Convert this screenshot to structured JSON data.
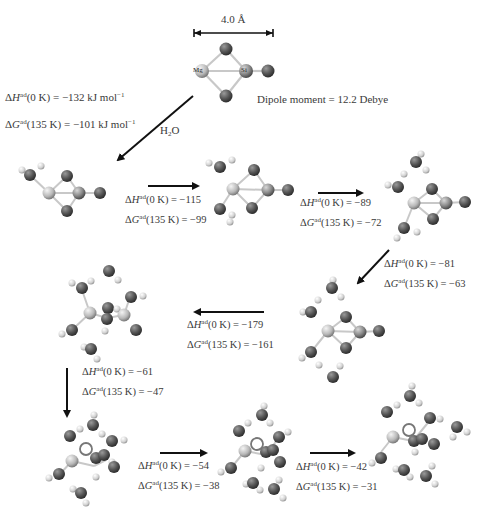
{
  "scale_bar": {
    "label": "4.0 Å"
  },
  "initial_cluster": {
    "atom_labels": [
      "Mg",
      "Si",
      "O",
      "O",
      "O"
    ],
    "dipole_label": "Dipole moment = 12.2 Debye",
    "dipole_value": "12.2",
    "dipole_unit": "Debye"
  },
  "reactant": {
    "label": "H2O",
    "label_main": "H",
    "label_sub": "2",
    "label_tail": "O"
  },
  "steps": [
    {
      "id": 1,
      "dH_prefix": "ΔH",
      "dH_temp": "(0 K) = ",
      "dH_value": "−132 kJ mol",
      "dH_unit_exp": "−1",
      "dG_prefix": "ΔG",
      "dG_temp": "(135 K) = ",
      "dG_value": "−101 kJ mol",
      "dG_unit_exp": "−1"
    },
    {
      "id": 2,
      "dH_prefix": "ΔH",
      "dH_temp": "(0 K) = ",
      "dH_value": "−115",
      "dG_prefix": "ΔG",
      "dG_temp": "(135 K) = ",
      "dG_value": "−99"
    },
    {
      "id": 3,
      "dH_prefix": "ΔH",
      "dH_temp": "(0 K) = ",
      "dH_value": "−89",
      "dG_prefix": "ΔG",
      "dG_temp": "(135 K) = ",
      "dG_value": "−72"
    },
    {
      "id": 4,
      "dH_prefix": "ΔH",
      "dH_temp": "(0 K) = ",
      "dH_value": "−81",
      "dG_prefix": "ΔG",
      "dG_temp": "(135 K) = ",
      "dG_value": "−63"
    },
    {
      "id": 5,
      "dH_prefix": "ΔH",
      "dH_temp": "(0 K) = ",
      "dH_value": "−179",
      "dG_prefix": "ΔG",
      "dG_temp": "(135 K) = ",
      "dG_value": "−161"
    },
    {
      "id": 6,
      "dH_prefix": "ΔH",
      "dH_temp": "(0 K) = ",
      "dH_value": "−61",
      "dG_prefix": "ΔG",
      "dG_temp": "(135 K) = ",
      "dG_value": "−47"
    },
    {
      "id": 7,
      "dH_prefix": "ΔH",
      "dH_temp": "(0 K) = ",
      "dH_value": "−54",
      "dG_prefix": "ΔG",
      "dG_temp": "(135 K) = ",
      "dG_value": "−38"
    },
    {
      "id": 8,
      "dH_prefix": "ΔH",
      "dH_temp": "(0 K) = ",
      "dH_value": "−42",
      "dG_prefix": "ΔG",
      "dG_temp": "(135 K) = ",
      "dG_value": "−31"
    }
  ],
  "superscript": "ad",
  "colors": {
    "oxygen": "#555555",
    "hydrogen": "#d8d8d8",
    "metal": "#c8c8c8",
    "bond": "#c4c4c4",
    "arrow": "#111111",
    "text": "#3a3a3a"
  }
}
